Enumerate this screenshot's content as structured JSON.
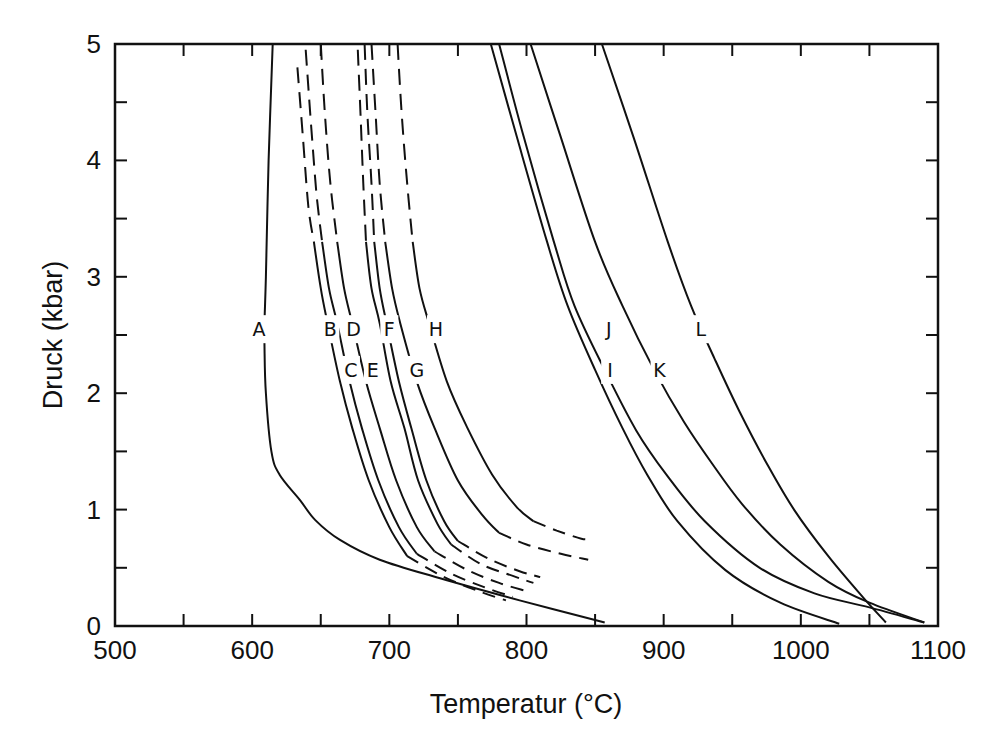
{
  "chart_data": {
    "type": "line",
    "title": "",
    "xlabel": "Temperatur (°C)",
    "ylabel": "Druck (kbar)",
    "xlim": [
      500,
      1100
    ],
    "ylim": [
      0,
      5
    ],
    "x_ticks": [
      500,
      600,
      700,
      800,
      900,
      1000,
      1100
    ],
    "x_minor_ticks": [
      550,
      650,
      750,
      850,
      950,
      1050
    ],
    "y_ticks": [
      0,
      1,
      2,
      3,
      4,
      5
    ],
    "y_minor_ticks": [
      0.5,
      1.5,
      2.5,
      3.5,
      4.5
    ],
    "grid": false,
    "legend": "none (curves labeled inline A–L)",
    "series": [
      {
        "name": "A",
        "label_pos": [
          605,
          2.55
        ],
        "solid": [
          [
            615,
            5.0
          ],
          [
            612,
            4.0
          ],
          [
            610,
            3.0
          ],
          [
            609,
            2.6
          ],
          [
            609,
            2.4
          ],
          [
            610,
            2.0
          ],
          [
            614,
            1.5
          ],
          [
            620,
            1.3
          ],
          [
            635,
            1.08
          ],
          [
            646,
            0.91
          ],
          [
            664,
            0.74
          ],
          [
            693,
            0.57
          ],
          [
            737,
            0.41
          ],
          [
            795,
            0.22
          ],
          [
            857,
            0.03
          ]
        ],
        "dashed": []
      },
      {
        "name": "B",
        "label_pos": [
          657,
          2.55
        ],
        "dashed": [
          [
            633,
            4.8
          ],
          [
            637,
            4.2
          ],
          [
            641,
            3.6
          ],
          [
            645,
            3.3
          ]
        ],
        "solid": [
          [
            645,
            3.3
          ],
          [
            650,
            2.9
          ],
          [
            655,
            2.6
          ],
          [
            664,
            2.1
          ],
          [
            673,
            1.7
          ],
          [
            685,
            1.25
          ],
          [
            700,
            0.85
          ],
          [
            713,
            0.6
          ]
        ],
        "dashed_tail": [
          [
            713,
            0.6
          ],
          [
            740,
            0.42
          ],
          [
            765,
            0.3
          ],
          [
            785,
            0.22
          ]
        ]
      },
      {
        "name": "C",
        "label_pos": [
          672,
          2.2
        ],
        "dashed": [
          [
            639,
            4.95
          ],
          [
            643,
            4.3
          ],
          [
            647,
            3.7
          ],
          [
            651,
            3.3
          ]
        ],
        "solid": [
          [
            651,
            3.3
          ],
          [
            656,
            2.9
          ],
          [
            662,
            2.6
          ],
          [
            671,
            2.1
          ],
          [
            680,
            1.7
          ],
          [
            692,
            1.25
          ],
          [
            707,
            0.85
          ],
          [
            720,
            0.62
          ]
        ],
        "dashed_tail": [
          [
            720,
            0.62
          ],
          [
            745,
            0.45
          ],
          [
            770,
            0.33
          ],
          [
            790,
            0.25
          ]
        ]
      },
      {
        "name": "D",
        "label_pos": [
          674,
          2.55
        ],
        "dashed": [
          [
            650,
            5.0
          ],
          [
            653,
            4.4
          ],
          [
            657,
            3.8
          ],
          [
            662,
            3.3
          ]
        ],
        "solid": [
          [
            662,
            3.3
          ],
          [
            667,
            2.9
          ],
          [
            673,
            2.6
          ],
          [
            683,
            2.1
          ],
          [
            693,
            1.7
          ],
          [
            705,
            1.25
          ],
          [
            720,
            0.85
          ],
          [
            733,
            0.64
          ]
        ],
        "dashed_tail": [
          [
            733,
            0.64
          ],
          [
            757,
            0.48
          ],
          [
            780,
            0.37
          ],
          [
            800,
            0.3
          ]
        ]
      },
      {
        "name": "E",
        "label_pos": [
          688,
          2.2
        ],
        "dashed": [
          [
            677,
            4.95
          ],
          [
            679,
            4.4
          ],
          [
            681,
            3.8
          ],
          [
            683,
            3.3
          ]
        ],
        "solid": [
          [
            683,
            3.3
          ],
          [
            687,
            2.9
          ],
          [
            693,
            2.6
          ],
          [
            701,
            2.1
          ],
          [
            711,
            1.7
          ],
          [
            721,
            1.25
          ],
          [
            735,
            0.88
          ],
          [
            745,
            0.7
          ]
        ],
        "dashed_tail": [
          [
            745,
            0.7
          ],
          [
            767,
            0.53
          ],
          [
            790,
            0.43
          ],
          [
            805,
            0.37
          ]
        ]
      },
      {
        "name": "F",
        "label_pos": [
          700,
          2.55
        ],
        "dashed": [
          [
            682,
            5.0
          ],
          [
            684,
            4.4
          ],
          [
            687,
            3.8
          ],
          [
            689,
            3.3
          ]
        ],
        "solid": [
          [
            689,
            3.3
          ],
          [
            693,
            2.9
          ],
          [
            698,
            2.6
          ],
          [
            707,
            2.1
          ],
          [
            716,
            1.7
          ],
          [
            727,
            1.25
          ],
          [
            740,
            0.9
          ],
          [
            750,
            0.73
          ]
        ],
        "dashed_tail": [
          [
            750,
            0.73
          ],
          [
            772,
            0.58
          ],
          [
            795,
            0.47
          ],
          [
            810,
            0.42
          ]
        ]
      },
      {
        "name": "G",
        "label_pos": [
          720,
          2.2
        ],
        "dashed": [
          [
            687,
            5.0
          ],
          [
            690,
            4.4
          ],
          [
            693,
            3.8
          ],
          [
            697,
            3.3
          ]
        ],
        "solid": [
          [
            697,
            3.3
          ],
          [
            702,
            2.9
          ],
          [
            708,
            2.6
          ],
          [
            720,
            2.1
          ],
          [
            733,
            1.7
          ],
          [
            750,
            1.25
          ],
          [
            768,
            0.95
          ],
          [
            780,
            0.8
          ]
        ],
        "dashed_tail": [
          [
            780,
            0.8
          ],
          [
            800,
            0.7
          ],
          [
            825,
            0.62
          ],
          [
            845,
            0.57
          ]
        ]
      },
      {
        "name": "H",
        "label_pos": [
          734,
          2.55
        ],
        "dashed": [
          [
            706,
            5.0
          ],
          [
            709,
            4.4
          ],
          [
            713,
            3.8
          ],
          [
            717,
            3.3
          ]
        ],
        "solid": [
          [
            717,
            3.3
          ],
          [
            722,
            2.9
          ],
          [
            729,
            2.6
          ],
          [
            742,
            2.1
          ],
          [
            757,
            1.7
          ],
          [
            775,
            1.3
          ],
          [
            793,
            1.02
          ],
          [
            805,
            0.9
          ]
        ],
        "dashed_tail": [
          [
            805,
            0.9
          ],
          [
            822,
            0.82
          ],
          [
            840,
            0.75
          ],
          [
            847,
            0.75
          ]
        ]
      },
      {
        "name": "I",
        "label_pos": [
          861,
          2.2
        ],
        "dashed": [],
        "solid": [
          [
            774,
            5.0
          ],
          [
            793,
            4.2
          ],
          [
            815,
            3.3
          ],
          [
            830,
            2.75
          ],
          [
            850,
            2.2
          ],
          [
            870,
            1.7
          ],
          [
            888,
            1.3
          ],
          [
            910,
            0.9
          ],
          [
            945,
            0.48
          ],
          [
            985,
            0.2
          ],
          [
            1028,
            0.02
          ]
        ]
      },
      {
        "name": "J",
        "label_pos": [
          860,
          2.55
        ],
        "dashed": [],
        "solid": [
          [
            780,
            5.0
          ],
          [
            798,
            4.2
          ],
          [
            820,
            3.3
          ],
          [
            835,
            2.75
          ],
          [
            857,
            2.2
          ],
          [
            880,
            1.68
          ],
          [
            902,
            1.3
          ],
          [
            930,
            0.9
          ],
          [
            970,
            0.5
          ],
          [
            1010,
            0.28
          ],
          [
            1050,
            0.16
          ],
          [
            1090,
            0.03
          ]
        ]
      },
      {
        "name": "K",
        "label_pos": [
          897,
          2.2
        ],
        "dashed": [],
        "solid": [
          [
            803,
            5.0
          ],
          [
            825,
            4.2
          ],
          [
            850,
            3.3
          ],
          [
            870,
            2.75
          ],
          [
            893,
            2.2
          ],
          [
            915,
            1.75
          ],
          [
            935,
            1.4
          ],
          [
            957,
            1.05
          ],
          [
            985,
            0.7
          ],
          [
            1020,
            0.38
          ],
          [
            1050,
            0.2
          ],
          [
            1090,
            0.03
          ]
        ]
      },
      {
        "name": "L",
        "label_pos": [
          927,
          2.55
        ],
        "dashed": [],
        "solid": [
          [
            855,
            5.0
          ],
          [
            878,
            4.2
          ],
          [
            903,
            3.3
          ],
          [
            920,
            2.75
          ],
          [
            937,
            2.3
          ],
          [
            955,
            1.85
          ],
          [
            975,
            1.4
          ],
          [
            995,
            1.0
          ],
          [
            1020,
            0.6
          ],
          [
            1045,
            0.25
          ],
          [
            1062,
            0.03
          ]
        ]
      }
    ]
  }
}
